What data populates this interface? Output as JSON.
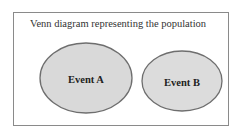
{
  "title": "Venn diagram representing the population",
  "events": [
    {
      "label": "Event A",
      "cx": 86,
      "cy": 78,
      "rx": 46,
      "ry": 35
    },
    {
      "label": "Event B",
      "cx": 182,
      "cy": 81,
      "rx": 40,
      "ry": 30
    }
  ],
  "colors": {
    "fill": "#d9d9d9",
    "stroke": "#6e6e6e",
    "frame": "#8a8a8a"
  }
}
